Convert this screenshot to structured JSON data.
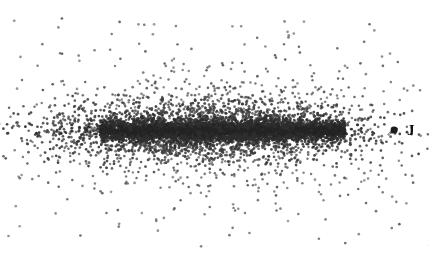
{
  "figure": {
    "width": 429,
    "height": 256,
    "background_color": "#ffffff",
    "has_axes": false,
    "has_frame": false,
    "has_gridlines": false,
    "has_tick_labels": false,
    "has_title": false,
    "has_legend": false
  },
  "chart_data": {
    "type": "scatter",
    "title": "",
    "subtitle": "",
    "xlabel": "",
    "ylabel": "",
    "xlim": [
      0,
      429
    ],
    "ylim": [
      0,
      256
    ],
    "grid": false,
    "legend_position": "none",
    "point_style": {
      "color": "#3a3a3a",
      "size_px": 1.35,
      "marker": "dot",
      "opacity": 0.88
    },
    "distribution": {
      "center_x": 208,
      "center_y": 131,
      "core": {
        "n_points": 3600,
        "x_span": [
          100,
          345
        ],
        "sigma_x": 66,
        "sigma_y": 5.2,
        "color": "#2e2e2e"
      },
      "inner_halo": {
        "n_points": 2400,
        "sigma_x": 80,
        "sigma_y": 15,
        "color": "#3d3d3d"
      },
      "outer_halo": {
        "n_points": 900,
        "sigma_x": 95,
        "sigma_y": 32,
        "color": "#4a4a4a"
      },
      "scattered_outliers": {
        "n_points": 120,
        "x_span": [
          8,
          420
        ],
        "y_span": [
          12,
          248
        ],
        "color": "#555555"
      }
    },
    "annotations": [
      {
        "name": "jupiter-marker",
        "label": "J",
        "x": 394,
        "y": 130,
        "marker_radius_px": 3.4,
        "marker_color": "#1c1c1c",
        "label_x": 407,
        "label_y": 130,
        "label_color": "#111111",
        "label_font_size_px": 15
      }
    ]
  },
  "annotation_labels": {
    "jupiter": "J"
  }
}
